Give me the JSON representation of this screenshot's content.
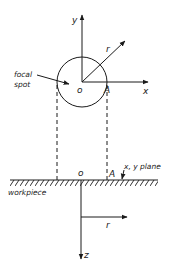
{
  "diagram": {
    "top_view": {
      "y_axis_label": "y",
      "x_axis_label": "x",
      "radius_label": "r",
      "origin_label": "o",
      "point_label": "A",
      "focal_spot_label_line1": "focal",
      "focal_spot_label_line2": "spot"
    },
    "side_view": {
      "origin_label": "o",
      "point_label": "A",
      "plane_label": "x, y plane",
      "workpiece_label": "workpiece",
      "radius_label": "r",
      "z_axis_label": "z"
    },
    "colors": {
      "ink": "#1a1a1a",
      "background": "#ffffff"
    }
  }
}
